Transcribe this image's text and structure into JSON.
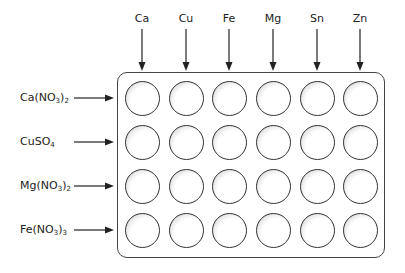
{
  "diagram": {
    "type": "well-plate",
    "columns": [
      {
        "label": "Ca"
      },
      {
        "label": "Cu"
      },
      {
        "label": "Fe"
      },
      {
        "label": "Mg"
      },
      {
        "label": "Sn"
      },
      {
        "label": "Zn"
      }
    ],
    "rows": [
      {
        "base": "Ca(NO",
        "sub1": "3",
        "mid": ")",
        "sub2": "2"
      },
      {
        "base": "CuSO",
        "sub1": "4",
        "mid": "",
        "sub2": ""
      },
      {
        "base": "Mg(NO",
        "sub1": "3",
        "mid": ")",
        "sub2": "2"
      },
      {
        "base": "Fe(NO",
        "sub1": "3",
        "mid": ")",
        "sub2": "3"
      }
    ],
    "well_count": 24
  }
}
